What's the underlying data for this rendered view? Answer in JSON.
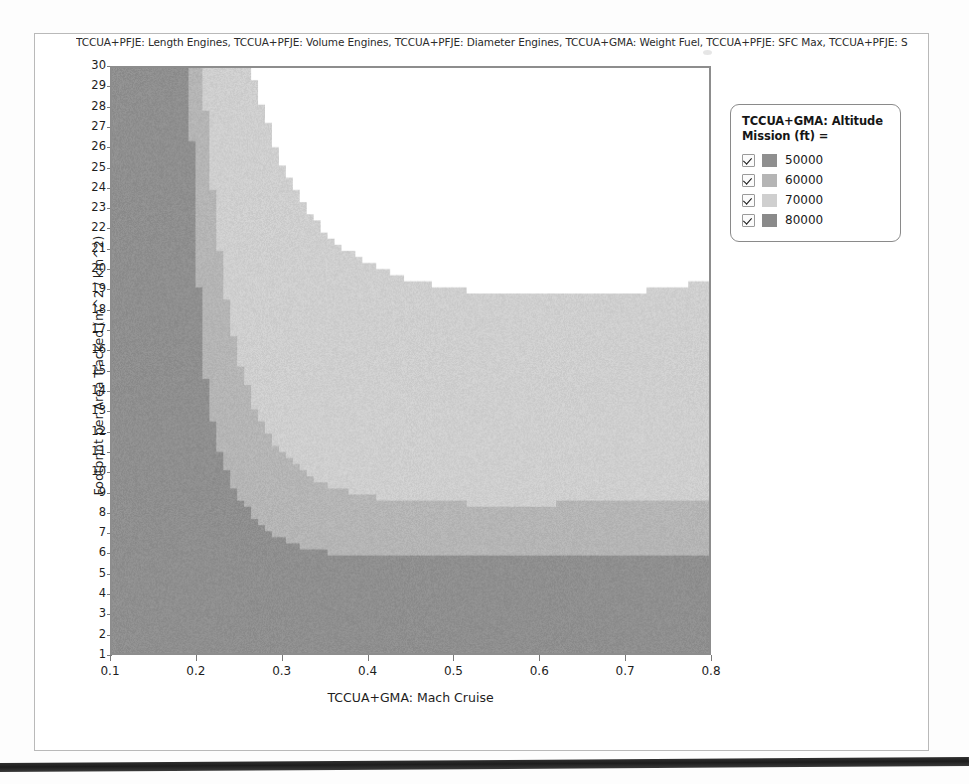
{
  "figure": {
    "title": "TCCUA+PFJE: Length Engines, TCCUA+PFJE: Volume Engines, TCCUA+PFJE: Diameter Engines, TCCUA+GMA: Weight Fuel, TCCUA+PFJE: SFC Max, TCCUA+PFJE: S"
  },
  "legend": {
    "title": "TCCUA+GMA: Altitude Mission (ft) =",
    "items": [
      {
        "label": "50000",
        "color": "#8f8f8f",
        "checked": true
      },
      {
        "label": "60000",
        "color": "#b5b5b5",
        "checked": true
      },
      {
        "label": "70000",
        "color": "#cfcfcf",
        "checked": true
      },
      {
        "label": "80000",
        "color": "#8a8a8a",
        "checked": true
      }
    ]
  },
  "chart_data": {
    "type": "area",
    "title": "TCCUA+PFJE: Length Engines, TCCUA+PFJE: Volume Engines, TCCUA+PFJE: Diameter Engines, TCCUA+GMA: Weight Fuel, TCCUA+PFJE: SFC Max, TCCUA+PFJE: S",
    "xlabel": "TCCUA+GMA: Mach Cruise",
    "ylabel": "Footprint per Area Tracked (m^2 / km^2)",
    "xlim": [
      0.1,
      0.8
    ],
    "ylim": [
      1,
      30
    ],
    "xticks": [
      0.1,
      0.2,
      0.3,
      0.4,
      0.5,
      0.6,
      0.7,
      0.8
    ],
    "yticks": [
      1,
      2,
      3,
      4,
      5,
      6,
      7,
      8,
      9,
      10,
      11,
      12,
      13,
      14,
      15,
      16,
      17,
      18,
      19,
      20,
      21,
      22,
      23,
      24,
      25,
      26,
      27,
      28,
      29,
      30
    ],
    "grid": false,
    "legend_position": "right",
    "background": "#ffffff",
    "series": [
      {
        "name": "50000",
        "color": "#8f8f8f",
        "note": "darkest band hugging the left axis, widening to the full lower plot at small Mach",
        "boundary": [
          {
            "x": 0.1,
            "y": 30.0
          },
          {
            "x": 0.19,
            "y": 30.0
          },
          {
            "x": 0.196,
            "y": 24.0
          },
          {
            "x": 0.203,
            "y": 18.0
          },
          {
            "x": 0.21,
            "y": 14.5
          },
          {
            "x": 0.22,
            "y": 12.0
          },
          {
            "x": 0.232,
            "y": 10.2
          },
          {
            "x": 0.248,
            "y": 8.8
          },
          {
            "x": 0.268,
            "y": 7.6
          },
          {
            "x": 0.292,
            "y": 6.8
          },
          {
            "x": 0.32,
            "y": 6.2
          },
          {
            "x": 0.36,
            "y": 5.9
          },
          {
            "x": 0.42,
            "y": 5.8
          },
          {
            "x": 0.5,
            "y": 5.8
          },
          {
            "x": 0.6,
            "y": 5.8
          },
          {
            "x": 0.66,
            "y": 5.9
          },
          {
            "x": 0.72,
            "y": 5.8
          },
          {
            "x": 0.8,
            "y": 5.9
          }
        ]
      },
      {
        "name": "60000",
        "color": "#b5b5b5",
        "note": "mid-gray band above the 50000 band",
        "boundary": [
          {
            "x": 0.1,
            "y": 30.0
          },
          {
            "x": 0.205,
            "y": 30.0
          },
          {
            "x": 0.218,
            "y": 24.0
          },
          {
            "x": 0.232,
            "y": 19.0
          },
          {
            "x": 0.25,
            "y": 15.2
          },
          {
            "x": 0.272,
            "y": 12.6
          },
          {
            "x": 0.3,
            "y": 10.8
          },
          {
            "x": 0.335,
            "y": 9.6
          },
          {
            "x": 0.38,
            "y": 8.9
          },
          {
            "x": 0.44,
            "y": 8.5
          },
          {
            "x": 0.52,
            "y": 8.4
          },
          {
            "x": 0.62,
            "y": 8.4
          },
          {
            "x": 0.7,
            "y": 8.5
          },
          {
            "x": 0.8,
            "y": 8.6
          }
        ]
      },
      {
        "name": "70000",
        "color": "#cfcfcf",
        "note": "lightest band; its upper edge sweeps down from the top-left then rises toward the right edge",
        "boundary": [
          {
            "x": 0.1,
            "y": 30.0
          },
          {
            "x": 0.262,
            "y": 30.0
          },
          {
            "x": 0.28,
            "y": 27.5
          },
          {
            "x": 0.3,
            "y": 25.2
          },
          {
            "x": 0.325,
            "y": 23.2
          },
          {
            "x": 0.355,
            "y": 21.6
          },
          {
            "x": 0.395,
            "y": 20.4
          },
          {
            "x": 0.44,
            "y": 19.6
          },
          {
            "x": 0.49,
            "y": 19.1
          },
          {
            "x": 0.545,
            "y": 18.8
          },
          {
            "x": 0.6,
            "y": 18.7
          },
          {
            "x": 0.65,
            "y": 18.7
          },
          {
            "x": 0.7,
            "y": 18.8
          },
          {
            "x": 0.75,
            "y": 19.1
          },
          {
            "x": 0.8,
            "y": 19.4
          }
        ]
      },
      {
        "name": "80000",
        "color": "#8a8a8a",
        "note": "checked in legend but no visible filled region inside the axes; upper-right of the plot is unfilled white"
      }
    ]
  },
  "axes": {
    "xlabel": "TCCUA+GMA: Mach Cruise",
    "ylabel": "Footprint per Area Tracked (m^2 / km^2)",
    "xticks": [
      "0.1",
      "0.2",
      "0.3",
      "0.4",
      "0.5",
      "0.6",
      "0.7",
      "0.8"
    ],
    "yticks": [
      "30",
      "29",
      "28",
      "27",
      "26",
      "25",
      "24",
      "23",
      "22",
      "21",
      "20",
      "19",
      "18",
      "17",
      "16",
      "15",
      "14",
      "13",
      "12",
      "11",
      "10",
      "9",
      "8",
      "7",
      "6",
      "5",
      "4",
      "3",
      "2",
      "1"
    ]
  }
}
